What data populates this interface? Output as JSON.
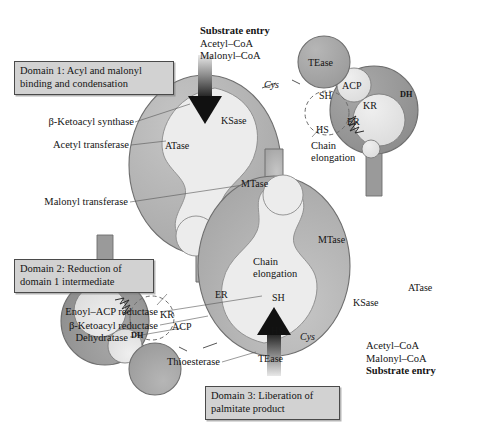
{
  "figure": {
    "colors": {
      "outer_lobe": "#b3b3b3",
      "outer_lobe_edge": "#6e6e6e",
      "cavity": "#ececec",
      "domain2_disc": "#9a9a9a",
      "subcircle": "#e3e3e3",
      "tease": "#a8a8a8",
      "box_fill": "#d2d2d2",
      "box_edge": "#4a4a4a",
      "arrow": "#111111",
      "background": "#ffffff"
    }
  },
  "domain_boxes": [
    {
      "id": "domain1",
      "line1": "Domain 1: Acyl and malonyl",
      "line2": "binding and condensation"
    },
    {
      "id": "domain2",
      "line1": "Domain 2: Reduction of",
      "line2": "domain 1 intermediate"
    },
    {
      "id": "domain3",
      "line1": "Domain 3: Liberation of",
      "line2": "palmitate product"
    }
  ],
  "substrate_top": {
    "heading": "Substrate entry",
    "line1": "Acetyl–CoA",
    "line2": "Malonyl–CoA"
  },
  "substrate_bottom": {
    "line1": "Acetyl–CoA",
    "line2": "Malonyl–CoA",
    "heading": "Substrate entry"
  },
  "left_labels": [
    {
      "id": "ketoacyl-synthase",
      "text": "β-Ketoacyl synthase"
    },
    {
      "id": "acetyl-transferase",
      "text": "Acetyl transferase"
    },
    {
      "id": "malonyl-transferase",
      "text": "Malonyl transferase"
    },
    {
      "id": "enoyl-acp-reductase",
      "text": "Enoyl–ACP reductase"
    },
    {
      "id": "ketoacyl-reductase",
      "text": "β-Ketoacyl reductase"
    },
    {
      "id": "dehydratase",
      "text": "Dehydratase"
    },
    {
      "id": "thioesterase",
      "text": "Thioesterase"
    }
  ],
  "chain_elongation": {
    "upper": {
      "line1": "Chain",
      "line2": "elongation"
    },
    "lower": {
      "line1": "Chain",
      "line2": "elongation"
    }
  },
  "thiol_groups": {
    "upper": {
      "sh": "SH",
      "hs": "HS",
      "cys": "Cys"
    },
    "lower": {
      "sh": "SH",
      "hs": "HS",
      "cys": "Cys"
    }
  },
  "enzyme_labels": {
    "upper_monomer": {
      "ksase": "KSase",
      "mtase": "MTase",
      "atase": "ATase",
      "tease": "TEase",
      "acp": "ACP",
      "kr": "KR",
      "dh": "DH",
      "er": "ER"
    },
    "lower_monomer": {
      "ksase": "KSase",
      "mtase": "MTase",
      "atase": "ATase",
      "tease": "TEase",
      "acp": "ACP",
      "kr": "KR",
      "dh": "DH",
      "er": "ER"
    }
  }
}
